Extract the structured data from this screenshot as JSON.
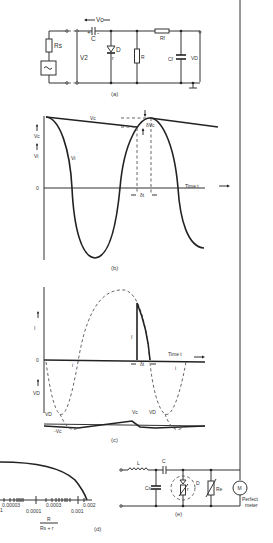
{
  "figure_a": {
    "caption": "(a)",
    "labels": {
      "vc": "Vc",
      "rs": "Rs",
      "c": "C",
      "plus": "+",
      "minus": "-",
      "v2": "V2",
      "d": "D",
      "r_diode": "r",
      "r": "R",
      "rf": "Rf",
      "cf": "Cf",
      "vd": "VD"
    }
  },
  "figure_b": {
    "caption": "(b)",
    "labels": {
      "vc_axis": "Vc",
      "vi_axis": "Vi",
      "zero": "0",
      "vc_curve": "Vc",
      "vi_curve": "Vi",
      "delta_vc": "δVc",
      "delta_t": "δt",
      "time": "Time t"
    }
  },
  "figure_c": {
    "caption": "(c)",
    "labels": {
      "i_axis": "I",
      "zero": "0",
      "i_pulse": "I",
      "i_small_1": "i",
      "i_small_2": "i",
      "delta_t": "δt",
      "time": "Time t",
      "vd_axis": "VD",
      "vd_1": "VD",
      "vc_1": "-Vc",
      "vc_2": "Vc",
      "vd_2": "VD"
    }
  },
  "figure_d": {
    "caption": "(d)",
    "ticks_top": [
      "0.00003",
      "0.0003",
      "0.002"
    ],
    "ticks_bottom": [
      "0.0001",
      "0.001"
    ],
    "tick_left_cut": "1",
    "xlabel_num": "R",
    "xlabel_den": "Rs + r"
  },
  "figure_e": {
    "caption": "(e)",
    "labels": {
      "l": "L",
      "c": "C",
      "cs": "Cs",
      "d": "D",
      "r": "r",
      "re": "Re",
      "m": "M",
      "meter_1": "Perfect",
      "meter_2": "meter"
    }
  }
}
